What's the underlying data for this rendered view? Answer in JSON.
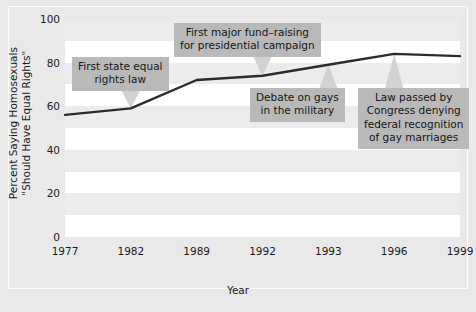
{
  "chart_data": {
    "type": "line",
    "title": "",
    "subtitle": "",
    "xlabel": "Year",
    "ylabel": "Percent Saying Homosexuals \"Should Have Equal Rights\"",
    "ylabel_lines": [
      "Percent Saying Homosexuals",
      "\"Should Have Equal Rights\""
    ],
    "categories": [
      "1977",
      "1982",
      "1989",
      "1992",
      "1993",
      "1996",
      "1999"
    ],
    "values": [
      56,
      59,
      72,
      74,
      79,
      84,
      83
    ],
    "series": [
      {
        "name": "Percent saying homosexuals should have equal rights",
        "values": [
          56,
          59,
          72,
          74,
          79,
          84,
          83
        ]
      }
    ],
    "ylim": [
      0,
      100
    ],
    "yticks": [
      0,
      20,
      40,
      60,
      80,
      100
    ],
    "ytick_labels": [
      "0",
      "20",
      "40",
      "60",
      "80",
      "100"
    ],
    "xtick_labels": [
      "1977",
      "1982",
      "1989",
      "1992",
      "1993",
      "1996",
      "1999"
    ],
    "grid": false,
    "banding": "alternating horizontal bands every 10 units",
    "legend": "none",
    "line_color": "#2b2b2b",
    "band_color": "#ececec",
    "plot_background": "#ffffff",
    "figure_background": "#e9e9e9",
    "callout_background": "#b9b9b9",
    "annotations": [
      {
        "id": "first-state-equal-rights-law",
        "lines": [
          "First state equal",
          "rights law"
        ],
        "text": "First state equal rights law",
        "points_to_category": "1982",
        "points_to_value": 59
      },
      {
        "id": "first-major-fund-raising",
        "lines": [
          "First major fund–raising",
          "for presidential campaign"
        ],
        "text": "First major fund–raising for presidential campaign",
        "points_to_category": "1992",
        "points_to_value": 74
      },
      {
        "id": "debate-on-gays-in-the-military",
        "lines": [
          "Debate on gays",
          "in the military"
        ],
        "text": "Debate on gays in the military",
        "points_to_category": "1993",
        "points_to_value": 79
      },
      {
        "id": "law-passed-by-congress",
        "lines": [
          "Law passed by",
          "Congress denying",
          "federal recognition",
          "of gay marriages"
        ],
        "text": "Law passed by Congress denying federal recognition of gay marriages",
        "points_to_category": "1996",
        "points_to_value": 84
      }
    ]
  }
}
